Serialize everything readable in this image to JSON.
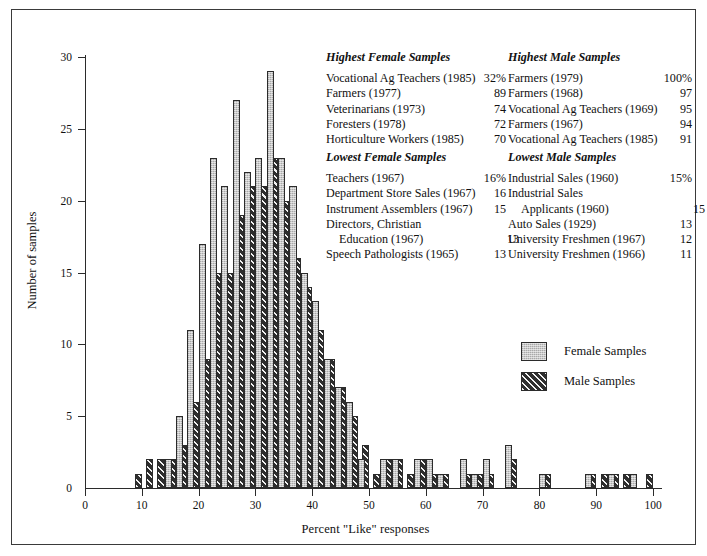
{
  "chart_data": {
    "type": "bar",
    "title": "",
    "xlabel": "Percent \"Like\" responses",
    "ylabel": "Number of samples",
    "xlim": [
      0,
      100
    ],
    "ylim": [
      0,
      30
    ],
    "xticks": [
      0,
      10,
      20,
      30,
      40,
      50,
      60,
      70,
      80,
      90,
      100
    ],
    "yticks": [
      0,
      5,
      10,
      15,
      20,
      25,
      30
    ],
    "grid": false,
    "bin_width": 2,
    "legend_position": "center-right",
    "series": [
      {
        "name": "Female Samples",
        "bin_starts": [
          8,
          10,
          12,
          14,
          16,
          18,
          20,
          22,
          24,
          26,
          28,
          30,
          32,
          34,
          36,
          38,
          40,
          42,
          44,
          46,
          48,
          50,
          52,
          54,
          56,
          58,
          60,
          62,
          64,
          66,
          68,
          70,
          72,
          74,
          76,
          78,
          80,
          82,
          84,
          86,
          88,
          90,
          92,
          94,
          96,
          98
        ],
        "values": [
          0,
          0,
          0,
          2,
          5,
          11,
          17,
          23,
          21,
          27,
          22,
          23,
          29,
          23,
          21,
          15,
          13,
          9,
          7,
          6,
          2,
          0,
          2,
          2,
          0,
          2,
          2,
          1,
          0,
          2,
          1,
          2,
          0,
          3,
          0,
          0,
          1,
          0,
          0,
          0,
          1,
          0,
          1,
          0,
          1,
          0
        ]
      },
      {
        "name": "Male Samples",
        "bin_starts": [
          8,
          10,
          12,
          14,
          16,
          18,
          20,
          22,
          24,
          26,
          28,
          30,
          32,
          34,
          36,
          38,
          40,
          42,
          44,
          46,
          48,
          50,
          52,
          54,
          56,
          58,
          60,
          62,
          64,
          66,
          68,
          70,
          72,
          74,
          76,
          78,
          80,
          82,
          84,
          86,
          88,
          90,
          92,
          94,
          96,
          98
        ],
        "values": [
          1,
          2,
          2,
          2,
          3,
          6,
          9,
          15,
          15,
          19,
          21,
          21,
          23,
          20,
          16,
          14,
          11,
          9,
          7,
          5,
          3,
          1,
          2,
          2,
          1,
          2,
          1,
          1,
          0,
          1,
          1,
          1,
          0,
          2,
          0,
          0,
          1,
          0,
          0,
          0,
          1,
          1,
          1,
          1,
          0,
          1
        ]
      }
    ]
  },
  "axes": {
    "y_label": "Number of samples",
    "x_label": "Percent \"Like\" responses",
    "x_tick_labels": [
      "0",
      "10",
      "20",
      "30",
      "40",
      "50",
      "60",
      "70",
      "80",
      "90",
      "100"
    ],
    "y_tick_labels": [
      "0",
      "5",
      "10",
      "15",
      "20",
      "25",
      "30"
    ]
  },
  "annotations": {
    "female_high": {
      "title": "Highest Female Samples",
      "rows": [
        {
          "name": "Vocational Ag Teachers (1985)",
          "value": "32%",
          "indent": false
        },
        {
          "name": "Farmers (1977)",
          "value": "89",
          "indent": false
        },
        {
          "name": "Veterinarians (1973)",
          "value": "74",
          "indent": false
        },
        {
          "name": "Foresters (1978)",
          "value": "72",
          "indent": false
        },
        {
          "name": "Horticulture Workers (1985)",
          "value": "70",
          "indent": false
        }
      ]
    },
    "male_high": {
      "title": "Highest Male Samples",
      "rows": [
        {
          "name": "Farmers (1979)",
          "value": "100%",
          "indent": false
        },
        {
          "name": "Farmers (1968)",
          "value": "97",
          "indent": false
        },
        {
          "name": "Vocational Ag Teachers (1969)",
          "value": "95",
          "indent": false
        },
        {
          "name": "Farmers (1967)",
          "value": "94",
          "indent": false
        },
        {
          "name": "Vocational Ag Teachers (1985)",
          "value": "91",
          "indent": false
        }
      ]
    },
    "female_low": {
      "title": "Lowest Female Samples",
      "rows": [
        {
          "name": "Teachers (1967)",
          "value": "16%",
          "indent": false
        },
        {
          "name": "Department Store Sales (1967)",
          "value": "16",
          "indent": false
        },
        {
          "name": "Instrument Assemblers (1967)",
          "value": "15",
          "indent": false
        },
        {
          "name": "Directors, Christian",
          "value": "",
          "indent": false
        },
        {
          "name": "Education (1967)",
          "value": "13",
          "indent": true
        },
        {
          "name": "Speech Pathologists (1965)",
          "value": "13",
          "indent": false
        }
      ]
    },
    "male_low": {
      "title": "Lowest Male Samples",
      "rows": [
        {
          "name": "Industrial Sales (1960)",
          "value": "15%",
          "indent": false
        },
        {
          "name": "Industrial Sales",
          "value": "",
          "indent": false
        },
        {
          "name": "Applicants (1960)",
          "value": "15",
          "indent": true
        },
        {
          "name": "Auto Sales (1929)",
          "value": "13",
          "indent": false
        },
        {
          "name": "University Freshmen (1967)",
          "value": "12",
          "indent": false
        },
        {
          "name": "University Freshmen (1966)",
          "value": "11",
          "indent": false
        }
      ]
    }
  },
  "legend": {
    "items": [
      {
        "label": "Female Samples",
        "swatch": "female",
        "color": "#c9c9c9"
      },
      {
        "label": "Male Samples",
        "swatch": "male",
        "color": "#3b3b3b"
      }
    ]
  },
  "colors": {
    "female_fill": "#c9c9c9",
    "male_fill": "#3b3b3b",
    "outline": "#2b2b2b",
    "frame": "#3a3a3a",
    "background": "#ffffff"
  }
}
